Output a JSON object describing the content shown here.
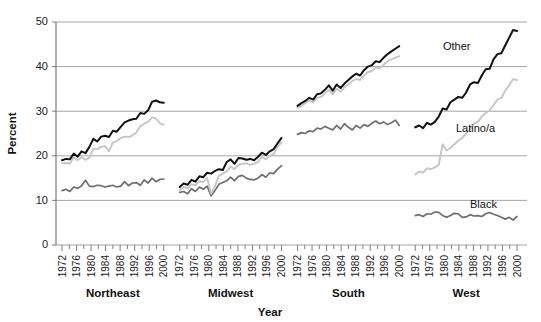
{
  "chart_data": {
    "type": "line",
    "title": "",
    "xlabel": "Year",
    "ylabel": "Percent",
    "ylim": [
      0,
      50
    ],
    "yticks": [
      0,
      10,
      20,
      30,
      40,
      50
    ],
    "ytick_labels": [
      "0",
      "10",
      "20",
      "30",
      "40",
      "50"
    ],
    "grid": true,
    "legend_position": "inline-annotations",
    "x": [
      1972,
      1973,
      1974,
      1975,
      1976,
      1977,
      1978,
      1979,
      1980,
      1981,
      1982,
      1983,
      1984,
      1985,
      1986,
      1987,
      1988,
      1989,
      1990,
      1991,
      1992,
      1993,
      1994,
      1995,
      1996,
      1997,
      1998,
      1999,
      2000
    ],
    "xtick_labels": [
      "1972",
      "1976",
      "1980",
      "1984",
      "1988",
      "1992",
      "1996",
      "2000"
    ],
    "xtick_years": [
      1972,
      1976,
      1980,
      1984,
      1988,
      1992,
      1996,
      2000
    ],
    "annotations": [
      {
        "text": "Other",
        "series": "Other"
      },
      {
        "text": "Latino/a",
        "series": "Latino/a"
      },
      {
        "text": "Black",
        "series": "Black"
      }
    ],
    "series_styles": [
      {
        "name": "Other",
        "color": "#111111",
        "width": 2.0
      },
      {
        "name": "Latino/a",
        "color": "#c6c6c6",
        "width": 1.9
      },
      {
        "name": "Black",
        "color": "#6e6e6e",
        "width": 1.7
      }
    ],
    "panels": [
      {
        "name": "Northeast",
        "label": "Northeast",
        "series": [
          {
            "name": "Other",
            "color": "#111111",
            "values": [
              19.0,
              19.3,
              19.2,
              20.5,
              19.8,
              21.0,
              20.6,
              22.0,
              23.8,
              23.2,
              24.3,
              24.5,
              24.2,
              25.6,
              25.4,
              26.5,
              27.5,
              27.9,
              28.2,
              28.3,
              29.6,
              29.4,
              30.2,
              32.1,
              32.4,
              32.0,
              31.9
            ]
          },
          {
            "name": "Latino/a",
            "color": "#c6c6c6",
            "values": [
              18.3,
              18.4,
              18.3,
              19.6,
              19.0,
              19.7,
              19.1,
              19.6,
              21.6,
              21.5,
              22.0,
              22.2,
              21.0,
              23.0,
              23.3,
              24.0,
              24.3,
              24.2,
              24.6,
              25.2,
              26.6,
              27.2,
              27.6,
              28.6,
              28.4,
              27.3,
              27.0
            ]
          },
          {
            "name": "Black",
            "color": "#6e6e6e",
            "values": [
              12.2,
              12.5,
              12.0,
              13.0,
              12.7,
              13.3,
              14.5,
              13.2,
              13.1,
              13.4,
              13.3,
              13.0,
              13.2,
              13.4,
              13.0,
              13.2,
              14.2,
              13.3,
              13.9,
              14.0,
              13.4,
              14.6,
              13.9,
              15.0,
              14.2,
              14.7,
              14.8
            ]
          }
        ]
      },
      {
        "name": "Midwest",
        "label": "Midwest",
        "series": [
          {
            "name": "Other",
            "color": "#111111",
            "values": [
              13.0,
              13.8,
              13.5,
              14.6,
              14.2,
              15.4,
              15.2,
              16.2,
              16.0,
              16.6,
              17.0,
              16.8,
              18.6,
              19.2,
              18.2,
              19.5,
              19.4,
              19.1,
              19.3,
              19.0,
              19.8,
              20.7,
              20.2,
              21.0,
              21.5,
              22.8,
              24.0
            ]
          },
          {
            "name": "Latino/a",
            "color": "#c6c6c6",
            "values": [
              12.3,
              13.0,
              12.7,
              13.6,
              13.4,
              14.3,
              14.1,
              15.0,
              11.5,
              13.2,
              15.5,
              16.0,
              16.5,
              17.6,
              17.0,
              18.0,
              18.2,
              18.3,
              18.0,
              18.2,
              18.6,
              19.8,
              19.2,
              20.0,
              20.4,
              22.0,
              23.0
            ]
          },
          {
            "name": "Black",
            "color": "#6e6e6e",
            "values": [
              11.8,
              12.0,
              11.5,
              12.6,
              12.0,
              13.0,
              12.5,
              13.2,
              11.0,
              12.2,
              13.6,
              14.0,
              14.4,
              15.2,
              14.4,
              15.4,
              15.6,
              15.0,
              14.7,
              14.6,
              15.0,
              15.8,
              15.2,
              16.2,
              16.0,
              17.0,
              17.8
            ]
          }
        ]
      },
      {
        "name": "South",
        "label": "South",
        "series": [
          {
            "name": "Other",
            "color": "#111111",
            "values": [
              31.2,
              31.8,
              32.3,
              33.0,
              32.6,
              33.8,
              34.0,
              34.8,
              35.8,
              34.6,
              36.0,
              35.2,
              36.2,
              37.0,
              37.8,
              38.4,
              38.0,
              39.2,
              40.0,
              40.3,
              41.2,
              41.0,
              42.0,
              42.8,
              43.4,
              44.0,
              44.6
            ]
          },
          {
            "name": "Latino/a",
            "color": "#c6c6c6",
            "values": [
              30.8,
              31.2,
              31.8,
              32.4,
              32.0,
              33.0,
              33.2,
              34.0,
              34.8,
              33.8,
              35.0,
              34.4,
              35.4,
              36.0,
              36.8,
              37.2,
              37.0,
              38.0,
              38.8,
              39.0,
              39.8,
              39.6,
              40.4,
              41.2,
              41.6,
              42.0,
              42.3
            ]
          },
          {
            "name": "Black",
            "color": "#6e6e6e",
            "values": [
              24.8,
              25.2,
              25.0,
              25.6,
              25.4,
              26.2,
              26.0,
              26.6,
              26.2,
              25.8,
              26.8,
              26.0,
              27.2,
              26.4,
              25.8,
              26.8,
              26.2,
              27.0,
              26.6,
              27.3,
              27.8,
              27.2,
              27.6,
              27.0,
              27.4,
              28.0,
              26.8
            ]
          }
        ]
      },
      {
        "name": "West",
        "label": "West",
        "series": [
          {
            "name": "Other",
            "color": "#111111",
            "values": [
              26.4,
              26.8,
              26.2,
              27.4,
              27.0,
              27.6,
              28.8,
              30.6,
              30.4,
              32.0,
              32.6,
              33.2,
              33.0,
              34.2,
              36.0,
              36.5,
              36.3,
              38.0,
              39.4,
              39.5,
              41.6,
              42.8,
              43.0,
              44.8,
              46.5,
              48.2,
              48.0
            ]
          },
          {
            "name": "Latino/a",
            "color": "#c6c6c6",
            "values": [
              15.8,
              16.5,
              16.2,
              17.2,
              17.0,
              17.4,
              18.0,
              22.6,
              21.2,
              21.8,
              22.6,
              23.4,
              24.0,
              25.0,
              26.0,
              27.2,
              27.6,
              28.8,
              29.6,
              30.2,
              31.4,
              32.6,
              33.0,
              34.6,
              35.8,
              37.2,
              37.0
            ]
          },
          {
            "name": "Black",
            "color": "#6e6e6e",
            "values": [
              6.6,
              6.8,
              6.4,
              7.0,
              6.9,
              7.4,
              7.3,
              6.6,
              6.2,
              6.6,
              7.1,
              7.0,
              6.2,
              6.3,
              6.8,
              6.5,
              6.6,
              6.4,
              7.0,
              7.3,
              6.9,
              6.6,
              6.2,
              5.8,
              6.2,
              5.6,
              6.4
            ]
          }
        ]
      }
    ]
  },
  "axes": {
    "ylabel": "Percent",
    "xlabel": "Year"
  }
}
